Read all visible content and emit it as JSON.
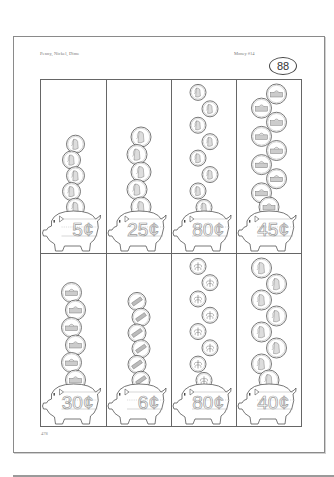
{
  "header": {
    "topic": "Penny, Nickel, Dime",
    "worksheet": "Money #14",
    "badge_number": "88"
  },
  "footer": {
    "page_number": "478"
  },
  "cells": [
    {
      "row": 1,
      "col": 1,
      "coin": "penny",
      "side": "heads",
      "count": 5,
      "amount": "5¢"
    },
    {
      "row": 1,
      "col": 2,
      "coin": "nickel",
      "side": "heads",
      "count": 5,
      "amount": "25¢"
    },
    {
      "row": 1,
      "col": 3,
      "coin": "dime",
      "side": "heads",
      "count": 8,
      "amount": "80¢"
    },
    {
      "row": 1,
      "col": 4,
      "coin": "nickel",
      "side": "tails",
      "count": 9,
      "amount": "45¢"
    },
    {
      "row": 2,
      "col": 1,
      "coin": "nickel",
      "side": "tails",
      "count": 6,
      "amount": "30¢"
    },
    {
      "row": 2,
      "col": 2,
      "coin": "penny",
      "side": "tails",
      "count": 6,
      "amount": "6¢"
    },
    {
      "row": 2,
      "col": 3,
      "coin": "dime",
      "side": "tails",
      "count": 8,
      "amount": "80¢"
    },
    {
      "row": 2,
      "col": 4,
      "coin": "nickel",
      "side": "heads",
      "count": 8,
      "amount": "40¢"
    }
  ],
  "colors": {
    "line": "#555555",
    "trace_digits": "#9a9a9a"
  }
}
